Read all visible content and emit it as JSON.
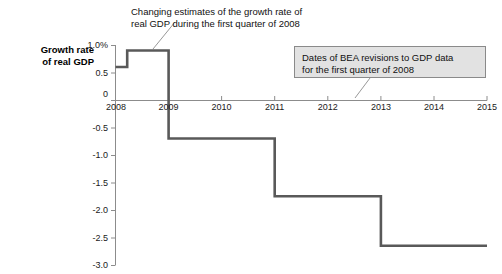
{
  "chart_data": {
    "type": "line",
    "subtype": "step",
    "title": "",
    "xlabel": "",
    "ylabel": "Growth rate\nof real GDP",
    "ylabel_lines": [
      "Growth rate",
      "of real GDP"
    ],
    "xlim": [
      2008,
      2015
    ],
    "ylim": [
      -3.0,
      1.0
    ],
    "grid": false,
    "legend": "none",
    "x_tick_labels": [
      "2008",
      "2009",
      "2010",
      "2011",
      "2012",
      "2013",
      "2014",
      "2015"
    ],
    "x_tick_values": [
      2008,
      2009,
      2010,
      2011,
      2012,
      2013,
      2014,
      2015
    ],
    "y_tick_labels": [
      "1.0%",
      "0.5",
      "0",
      "-0.5",
      "-1.0",
      "-1.5",
      "-2.0",
      "-2.5",
      "-3.0"
    ],
    "y_tick_values": [
      1.0,
      0.5,
      0,
      -0.5,
      -1.0,
      -1.5,
      -2.0,
      -2.5,
      -3.0
    ],
    "series": [
      {
        "name": "Estimates of 2008 Q1 real GDP growth rate",
        "color": "#595959",
        "steps": [
          {
            "x_start": 2008.0,
            "x_end": 2008.22,
            "value": 0.6
          },
          {
            "x_start": 2008.22,
            "x_end": 2009.0,
            "value": 0.9
          },
          {
            "x_start": 2009.0,
            "x_end": 2011.0,
            "value": -0.7
          },
          {
            "x_start": 2011.0,
            "x_end": 2013.0,
            "value": -1.75
          },
          {
            "x_start": 2013.0,
            "x_end": 2015.0,
            "value": -2.65
          }
        ]
      }
    ],
    "annotations": [
      {
        "id": "series-annotation",
        "text": "Changing estimates of the growth rate of\nreal GDP during the first quarter of 2008",
        "lines": [
          "Changing estimates of the growth rate of",
          "real GDP during the first quarter of 2008"
        ],
        "style": "plain-with-leader"
      },
      {
        "id": "revision-dates-callout",
        "text": "Dates of BEA revisions to GDP data\nfor the first quarter of 2008",
        "lines": [
          "Dates of BEA revisions to GDP data",
          "for the first quarter of 2008"
        ],
        "style": "boxed-with-leader",
        "fill": "#e2e2e2",
        "border": "#8a8a8a"
      }
    ]
  },
  "colors": {
    "line": "#595959",
    "axis": "#8c8c8c",
    "text": "#1a1a1a",
    "callout_fill": "#e2e2e2",
    "callout_border": "#8a8a8a",
    "background": "#ffffff"
  }
}
